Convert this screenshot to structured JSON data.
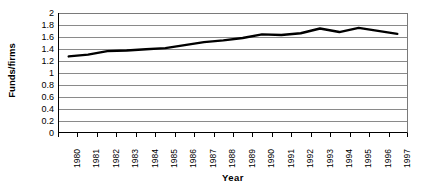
{
  "chart_data": {
    "type": "line",
    "title": "",
    "xlabel": "Year",
    "ylabel": "Funds/firms",
    "categories": [
      "1980",
      "1981",
      "1982",
      "1983",
      "1984",
      "1985",
      "1986",
      "1987",
      "1988",
      "1989",
      "1990",
      "1991",
      "1992",
      "1993",
      "1994",
      "1995",
      "1996",
      "1997"
    ],
    "values": [
      1.27,
      1.3,
      1.36,
      1.37,
      1.39,
      1.41,
      1.46,
      1.51,
      1.54,
      1.58,
      1.64,
      1.63,
      1.66,
      1.74,
      1.68,
      1.75,
      1.7,
      1.65
    ],
    "series": [
      {
        "name": "Funds/firms",
        "values": [
          1.27,
          1.3,
          1.36,
          1.37,
          1.39,
          1.41,
          1.46,
          1.51,
          1.54,
          1.58,
          1.64,
          1.63,
          1.66,
          1.74,
          1.68,
          1.75,
          1.7,
          1.65
        ]
      }
    ],
    "ylim": [
      0,
      2
    ],
    "yticks": [
      "0",
      "0.2",
      "0.4",
      "0.6",
      "0.8",
      "1",
      "1.2",
      "1.4",
      "1.6",
      "1.8",
      "2"
    ],
    "ytick_values": [
      0,
      0.2,
      0.4,
      0.6,
      0.8,
      1,
      1.2,
      1.4,
      1.6,
      1.8,
      2
    ],
    "grid": true,
    "grid_axis": "y",
    "legend": false,
    "legend_position": "none",
    "line_color": "#000000",
    "line_width": 2.4,
    "grid_color": "#8a8a8a",
    "axis_color": "#000000",
    "background_color": "#ffffff"
  }
}
